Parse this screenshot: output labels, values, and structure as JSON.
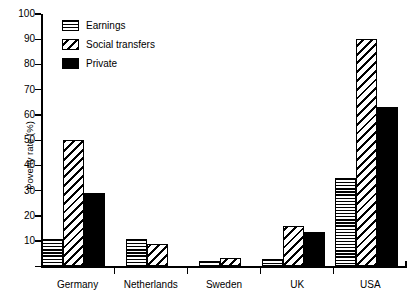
{
  "chart_data": {
    "type": "bar",
    "title": "",
    "xlabel": "",
    "ylabel": "Poverty rate (%)",
    "ylim": [
      0,
      100
    ],
    "ytick_step": 10,
    "yticks": [
      0,
      10,
      20,
      30,
      40,
      50,
      60,
      70,
      80,
      90,
      100
    ],
    "ytick_labels": [
      "0",
      "10",
      "20",
      "30",
      "40",
      "50",
      "60",
      "70",
      "80",
      "90",
      "100"
    ],
    "grid": false,
    "legend_position": "top-left-inside",
    "categories": [
      "Germany",
      "Netherlands",
      "Sweden",
      "UK",
      "USA"
    ],
    "series": [
      {
        "name": "Earnings",
        "pattern": "horizontal-lines",
        "values": [
          11,
          11,
          2,
          3,
          35
        ]
      },
      {
        "name": "Social transfers",
        "pattern": "diagonal-hatch",
        "values": [
          50,
          9,
          3.5,
          16,
          90
        ]
      },
      {
        "name": "Private",
        "pattern": "solid-black",
        "values": [
          29,
          null,
          null,
          13.5,
          63
        ]
      }
    ]
  },
  "legend": {
    "items": [
      {
        "label": "Earnings",
        "swatch": "horizontal-lines-swatch"
      },
      {
        "label": "Social transfers",
        "swatch": "diagonal-hatch-swatch"
      },
      {
        "label": "Private",
        "swatch": "solid-black-swatch"
      }
    ]
  },
  "colors": {
    "foreground": "#000000",
    "background": "#ffffff"
  }
}
